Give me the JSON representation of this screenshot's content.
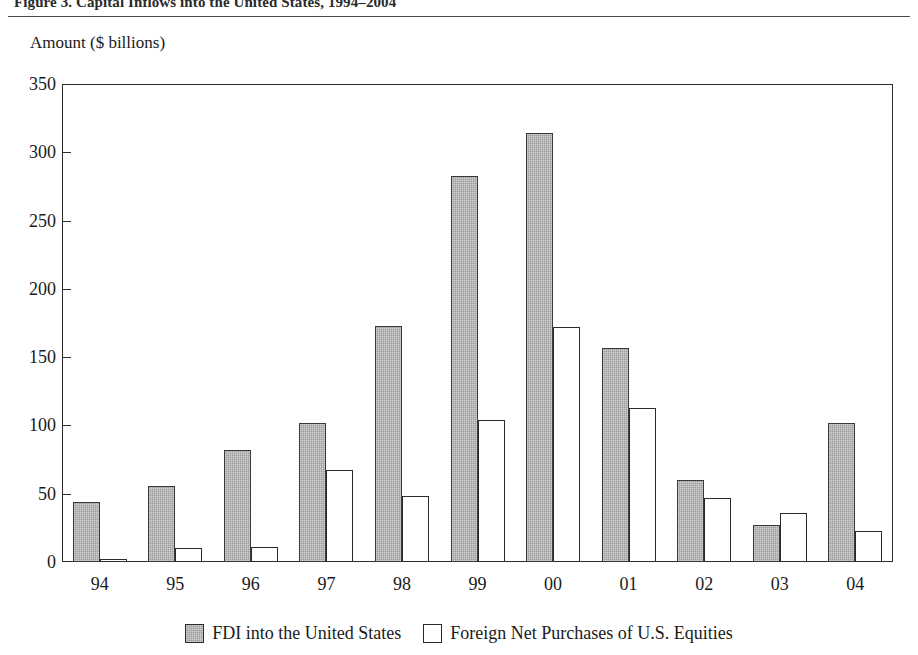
{
  "figure": {
    "title_partial": "Figure 3.   Capital Inflows into the United States, 1994–2004",
    "y_axis_caption": "Amount ($ billions)"
  },
  "colors": {
    "fdi_fill": "#9b9b9b",
    "equities_fill": "#ffffff",
    "axis": "#2b2b2b",
    "text": "#1a1a1a",
    "background": "#ffffff"
  },
  "legend": {
    "position": "bottom-center",
    "items": [
      {
        "label": "FDI into the United States",
        "swatch": "gray-filled-square"
      },
      {
        "label": "Foreign Net Purchases of U.S. Equities",
        "swatch": "white-outlined-square"
      }
    ]
  },
  "chart_data": {
    "type": "bar",
    "title": "Figure 3.   Capital Inflows into the United States, 1994–2004",
    "xlabel": "",
    "ylabel": "Amount ($ billions)",
    "categories": [
      "94",
      "95",
      "96",
      "97",
      "98",
      "99",
      "00",
      "01",
      "02",
      "03",
      "04"
    ],
    "ylim": [
      0,
      350
    ],
    "yticks": [
      0,
      50,
      100,
      150,
      200,
      250,
      300,
      350
    ],
    "ytick_labels": [
      "0",
      "50",
      "100",
      "150",
      "200",
      "250",
      "300",
      "350"
    ],
    "grid": false,
    "legend_position": "bottom-center",
    "series": [
      {
        "name": "FDI into the United States",
        "color": "#9b9b9b",
        "values": [
          44,
          56,
          82,
          102,
          173,
          283,
          314,
          157,
          60,
          27,
          102
        ]
      },
      {
        "name": "Foreign Net Purchases of U.S. Equities",
        "color": "#ffffff",
        "values": [
          2,
          10,
          11,
          67,
          48,
          104,
          172,
          113,
          47,
          36,
          23
        ]
      }
    ]
  }
}
